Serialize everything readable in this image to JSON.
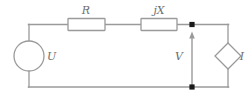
{
  "diagram": {
    "type": "electrical-schematic",
    "colors": {
      "wire": "#9a9a9a",
      "component_outline": "#9a9a9a",
      "component_fill": "#ffffff",
      "node_dot": "#1a1a1a",
      "label_text": "#6e6e6e",
      "background": "#ffffff"
    },
    "components": [
      {
        "id": "voltage-source",
        "symbol": "circle",
        "label": "U",
        "label_position": "right",
        "center": {
          "x": 29,
          "y": 56
        },
        "radius": 15
      },
      {
        "id": "resistor",
        "symbol": "rectangle",
        "label": "R",
        "label_position": "above",
        "box": {
          "x": 68,
          "y": 20,
          "width": 37,
          "height": 12
        }
      },
      {
        "id": "reactance",
        "symbol": "rectangle",
        "label": "jX",
        "label_position": "above",
        "box": {
          "x": 141,
          "y": 20,
          "width": 36,
          "height": 12
        }
      },
      {
        "id": "current-source",
        "symbol": "diamond",
        "label": "I",
        "label_position": "right",
        "center": {
          "x": 228,
          "y": 56
        },
        "half_diagonal": 13
      }
    ],
    "annotations": [
      {
        "id": "voltage-arrow",
        "label": "V",
        "label_position": "left",
        "arrow": {
          "x": 192,
          "y_tail": 85,
          "y_head": 33,
          "direction": "up"
        }
      }
    ],
    "nodes": [
      {
        "id": "node-top-right",
        "x": 192,
        "y": 24
      },
      {
        "id": "node-bottom-right",
        "x": 192,
        "y": 87
      }
    ],
    "labels": {
      "source_voltage": "U",
      "resistance": "R",
      "reactance": "jX",
      "terminal_voltage": "V",
      "source_current": "I"
    }
  }
}
